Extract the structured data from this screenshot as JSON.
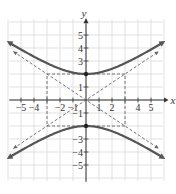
{
  "chart_data": {
    "type": "line",
    "title": "",
    "equation": "y^2/4 - x^2/9 = 1",
    "xlabel": "x",
    "ylabel": "y",
    "xlim": [
      -6,
      6
    ],
    "ylim": [
      -6,
      6
    ],
    "grid": true,
    "x_ticks": [
      -5,
      -4,
      -2,
      -1,
      1,
      2,
      4,
      5
    ],
    "x_tick_labels": [
      "−5",
      "−4",
      "−2",
      "−1",
      "1",
      "2",
      "4",
      "5"
    ],
    "y_ticks": [
      5,
      4,
      3,
      1,
      -1,
      -3,
      -4,
      -5
    ],
    "y_tick_labels": [
      "5",
      "4",
      "3",
      "1",
      "−1",
      "−3",
      "−4",
      "−5"
    ],
    "vertices": [
      [
        0,
        2
      ],
      [
        0,
        -2
      ]
    ],
    "fundamental_rectangle": {
      "x": [
        -3,
        3
      ],
      "y": [
        -2,
        2
      ]
    },
    "series": [
      {
        "name": "upper branch",
        "style": "solid",
        "color": "#555555",
        "description": "y = 2*sqrt(1 + x^2/9)"
      },
      {
        "name": "lower branch",
        "style": "solid",
        "color": "#555555",
        "description": "y = -2*sqrt(1 + x^2/9)"
      },
      {
        "name": "asymptote 1",
        "style": "dashed",
        "color": "#666666",
        "description": "y = (2/3)x"
      },
      {
        "name": "asymptote 2",
        "style": "dashed",
        "color": "#666666",
        "description": "y = -(2/3)x"
      }
    ],
    "colors": {
      "grid": "#d9d9d9",
      "axis": "#333333",
      "curve": "#555555",
      "dashed": "#666666"
    }
  }
}
